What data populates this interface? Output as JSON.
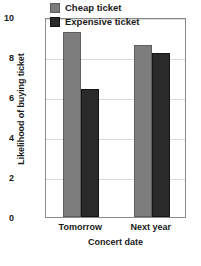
{
  "chart_data": {
    "type": "bar",
    "title": "",
    "xlabel": "Concert date",
    "ylabel": "Likelihood of buying ticket",
    "categories": [
      "Tomorrow",
      "Next year"
    ],
    "series": [
      {
        "name": "Cheap ticket",
        "values": [
          9.25,
          8.6
        ],
        "color": "#7d7d7d"
      },
      {
        "name": "Expensive ticket",
        "values": [
          6.4,
          8.2
        ],
        "color": "#2a2a2a"
      }
    ],
    "ylim": [
      0,
      10
    ],
    "yticks": [
      0,
      2,
      4,
      6,
      8,
      10
    ],
    "ytick_labels": [
      "0",
      "2",
      "4",
      "6",
      "8",
      "10"
    ],
    "grid": true,
    "legend_position": "top-right-inside"
  },
  "legend": {
    "items": [
      {
        "label": "Cheap ticket"
      },
      {
        "label": "Expensive ticket"
      }
    ]
  }
}
